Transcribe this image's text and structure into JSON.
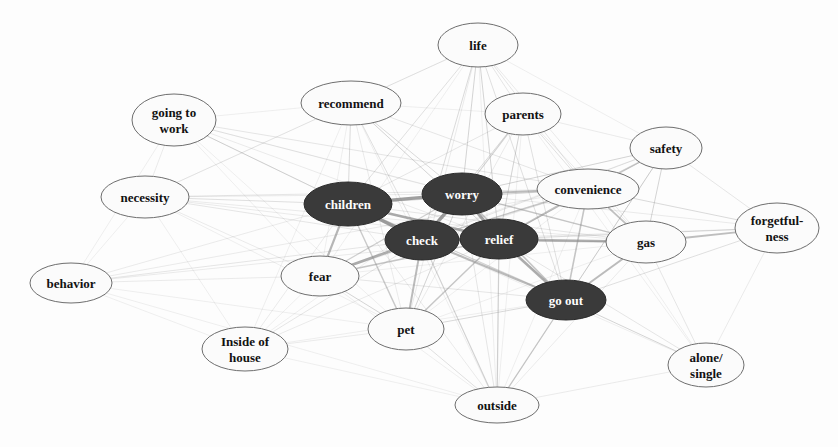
{
  "graph": {
    "title": "Co-occurrence network of reasons",
    "width": 838,
    "height": 447,
    "background_color": "#fdfdfd",
    "node_styles": {
      "dark_fill": "#3a3a3a",
      "dark_stroke": "#2b2b2b",
      "dark_text": "#fdfdfd",
      "light_fill": "#fbfbfb",
      "light_stroke": "#6e6e6e",
      "light_text": "#121212",
      "edge_color": "#8c8c8c"
    },
    "nodes": [
      {
        "id": "life",
        "label": "life",
        "lines": [
          "life"
        ],
        "cx": 478,
        "cy": 45,
        "rx": 40,
        "ry": 22,
        "style": "light",
        "font_size": 13
      },
      {
        "id": "recommend",
        "label": "recommend",
        "lines": [
          "recommend"
        ],
        "cx": 351,
        "cy": 103,
        "rx": 50,
        "ry": 22,
        "style": "light",
        "font_size": 13
      },
      {
        "id": "parents",
        "label": "parents",
        "lines": [
          "parents"
        ],
        "cx": 523,
        "cy": 114,
        "rx": 38,
        "ry": 21,
        "style": "light",
        "font_size": 13
      },
      {
        "id": "going_to_work",
        "label": "going to work",
        "lines": [
          "going to",
          "work"
        ],
        "cx": 174,
        "cy": 120,
        "rx": 42,
        "ry": 26,
        "style": "light",
        "font_size": 13
      },
      {
        "id": "safety",
        "label": "safety",
        "lines": [
          "safety"
        ],
        "cx": 666,
        "cy": 148,
        "rx": 36,
        "ry": 21,
        "style": "light",
        "font_size": 13
      },
      {
        "id": "convenience",
        "label": "convenience",
        "lines": [
          "convenience"
        ],
        "cx": 588,
        "cy": 189,
        "rx": 51,
        "ry": 20,
        "style": "light",
        "font_size": 13
      },
      {
        "id": "necessity",
        "label": "necessity",
        "lines": [
          "necessity"
        ],
        "cx": 145,
        "cy": 197,
        "rx": 44,
        "ry": 21,
        "style": "light",
        "font_size": 13
      },
      {
        "id": "children",
        "label": "children",
        "lines": [
          "children"
        ],
        "cx": 348,
        "cy": 204,
        "rx": 44,
        "ry": 22,
        "style": "dark",
        "font_size": 13
      },
      {
        "id": "worry",
        "label": "worry",
        "lines": [
          "worry"
        ],
        "cx": 462,
        "cy": 194,
        "rx": 40,
        "ry": 21,
        "style": "dark",
        "font_size": 13
      },
      {
        "id": "forgetfulness",
        "label": "forgetfulness",
        "lines": [
          "forgetful-",
          "ness"
        ],
        "cx": 777,
        "cy": 228,
        "rx": 42,
        "ry": 25,
        "style": "light",
        "font_size": 13
      },
      {
        "id": "check",
        "label": "check",
        "lines": [
          "check"
        ],
        "cx": 422,
        "cy": 240,
        "rx": 37,
        "ry": 20,
        "style": "dark",
        "font_size": 13
      },
      {
        "id": "relief",
        "label": "relief",
        "lines": [
          "relief"
        ],
        "cx": 499,
        "cy": 239,
        "rx": 39,
        "ry": 20,
        "style": "dark",
        "font_size": 13
      },
      {
        "id": "gas",
        "label": "gas",
        "lines": [
          "gas"
        ],
        "cx": 646,
        "cy": 242,
        "rx": 40,
        "ry": 21,
        "style": "light",
        "font_size": 13
      },
      {
        "id": "fear",
        "label": "fear",
        "lines": [
          "fear"
        ],
        "cx": 320,
        "cy": 276,
        "rx": 39,
        "ry": 20,
        "style": "light",
        "font_size": 13
      },
      {
        "id": "behavior",
        "label": "behavior",
        "lines": [
          "behavior"
        ],
        "cx": 71,
        "cy": 283,
        "rx": 41,
        "ry": 20,
        "style": "light",
        "font_size": 13
      },
      {
        "id": "go_out",
        "label": "go out",
        "lines": [
          "go out"
        ],
        "cx": 566,
        "cy": 300,
        "rx": 40,
        "ry": 20,
        "style": "dark",
        "font_size": 13
      },
      {
        "id": "pet",
        "label": "pet",
        "lines": [
          "pet"
        ],
        "cx": 406,
        "cy": 329,
        "rx": 38,
        "ry": 21,
        "style": "light",
        "font_size": 13
      },
      {
        "id": "inside_of_house",
        "label": "Inside of house",
        "lines": [
          "Inside of",
          "house"
        ],
        "cx": 245,
        "cy": 349,
        "rx": 43,
        "ry": 22,
        "style": "light",
        "font_size": 13
      },
      {
        "id": "alone_single",
        "label": "alone/single",
        "lines": [
          "alone/",
          "single"
        ],
        "cx": 706,
        "cy": 365,
        "rx": 38,
        "ry": 22,
        "style": "light",
        "font_size": 13
      },
      {
        "id": "outside",
        "label": "outside",
        "lines": [
          "outside"
        ],
        "cx": 497,
        "cy": 405,
        "rx": 42,
        "ry": 18,
        "style": "light",
        "font_size": 13
      }
    ],
    "edges": [
      {
        "source": "children",
        "target": "worry",
        "weight": 3.2
      },
      {
        "source": "children",
        "target": "check",
        "weight": 3.4
      },
      {
        "source": "children",
        "target": "relief",
        "weight": 2.8
      },
      {
        "source": "children",
        "target": "fear",
        "weight": 2.2
      },
      {
        "source": "children",
        "target": "pet",
        "weight": 1.4
      },
      {
        "source": "children",
        "target": "necessity",
        "weight": 0.8
      },
      {
        "source": "children",
        "target": "going_to_work",
        "weight": 0.8
      },
      {
        "source": "children",
        "target": "recommend",
        "weight": 0.9
      },
      {
        "source": "children",
        "target": "life",
        "weight": 0.8
      },
      {
        "source": "children",
        "target": "behavior",
        "weight": 0.6
      },
      {
        "source": "children",
        "target": "convenience",
        "weight": 1.0
      },
      {
        "source": "children",
        "target": "go_out",
        "weight": 1.1
      },
      {
        "source": "children",
        "target": "gas",
        "weight": 0.7
      },
      {
        "source": "children",
        "target": "inside_of_house",
        "weight": 0.6
      },
      {
        "source": "children",
        "target": "outside",
        "weight": 0.6
      },
      {
        "source": "children",
        "target": "parents",
        "weight": 0.7
      },
      {
        "source": "worry",
        "target": "check",
        "weight": 3.4
      },
      {
        "source": "worry",
        "target": "relief",
        "weight": 3.0
      },
      {
        "source": "worry",
        "target": "convenience",
        "weight": 2.0
      },
      {
        "source": "worry",
        "target": "parents",
        "weight": 1.1
      },
      {
        "source": "worry",
        "target": "life",
        "weight": 1.0
      },
      {
        "source": "worry",
        "target": "recommend",
        "weight": 0.9
      },
      {
        "source": "worry",
        "target": "gas",
        "weight": 1.3
      },
      {
        "source": "worry",
        "target": "go_out",
        "weight": 1.6
      },
      {
        "source": "worry",
        "target": "safety",
        "weight": 1.0
      },
      {
        "source": "worry",
        "target": "fear",
        "weight": 1.2
      },
      {
        "source": "worry",
        "target": "pet",
        "weight": 1.0
      },
      {
        "source": "worry",
        "target": "outside",
        "weight": 0.7
      },
      {
        "source": "worry",
        "target": "going_to_work",
        "weight": 0.6
      },
      {
        "source": "worry",
        "target": "necessity",
        "weight": 0.6
      },
      {
        "source": "worry",
        "target": "forgetfulness",
        "weight": 0.6
      },
      {
        "source": "worry",
        "target": "inside_of_house",
        "weight": 0.5
      },
      {
        "source": "check",
        "target": "relief",
        "weight": 3.6
      },
      {
        "source": "check",
        "target": "fear",
        "weight": 2.6
      },
      {
        "source": "check",
        "target": "pet",
        "weight": 2.0
      },
      {
        "source": "check",
        "target": "go_out",
        "weight": 2.0
      },
      {
        "source": "check",
        "target": "gas",
        "weight": 1.6
      },
      {
        "source": "check",
        "target": "convenience",
        "weight": 1.5
      },
      {
        "source": "check",
        "target": "outside",
        "weight": 1.1
      },
      {
        "source": "check",
        "target": "life",
        "weight": 0.9
      },
      {
        "source": "check",
        "target": "parents",
        "weight": 0.9
      },
      {
        "source": "check",
        "target": "recommend",
        "weight": 0.8
      },
      {
        "source": "check",
        "target": "necessity",
        "weight": 0.7
      },
      {
        "source": "check",
        "target": "going_to_work",
        "weight": 0.7
      },
      {
        "source": "check",
        "target": "behavior",
        "weight": 0.7
      },
      {
        "source": "check",
        "target": "inside_of_house",
        "weight": 0.7
      },
      {
        "source": "check",
        "target": "safety",
        "weight": 0.7
      },
      {
        "source": "check",
        "target": "forgetfulness",
        "weight": 0.6
      },
      {
        "source": "check",
        "target": "alone_single",
        "weight": 0.5
      },
      {
        "source": "relief",
        "target": "go_out",
        "weight": 2.6
      },
      {
        "source": "relief",
        "target": "gas",
        "weight": 2.2
      },
      {
        "source": "relief",
        "target": "convenience",
        "weight": 1.8
      },
      {
        "source": "relief",
        "target": "fear",
        "weight": 1.6
      },
      {
        "source": "relief",
        "target": "pet",
        "weight": 1.5
      },
      {
        "source": "relief",
        "target": "outside",
        "weight": 1.2
      },
      {
        "source": "relief",
        "target": "parents",
        "weight": 1.0
      },
      {
        "source": "relief",
        "target": "life",
        "weight": 1.0
      },
      {
        "source": "relief",
        "target": "safety",
        "weight": 0.9
      },
      {
        "source": "relief",
        "target": "recommend",
        "weight": 0.8
      },
      {
        "source": "relief",
        "target": "forgetfulness",
        "weight": 0.9
      },
      {
        "source": "relief",
        "target": "alone_single",
        "weight": 0.7
      },
      {
        "source": "relief",
        "target": "necessity",
        "weight": 0.6
      },
      {
        "source": "relief",
        "target": "going_to_work",
        "weight": 0.6
      },
      {
        "source": "relief",
        "target": "behavior",
        "weight": 0.6
      },
      {
        "source": "relief",
        "target": "inside_of_house",
        "weight": 0.6
      },
      {
        "source": "go_out",
        "target": "gas",
        "weight": 2.0
      },
      {
        "source": "go_out",
        "target": "convenience",
        "weight": 1.6
      },
      {
        "source": "go_out",
        "target": "outside",
        "weight": 1.3
      },
      {
        "source": "go_out",
        "target": "alone_single",
        "weight": 1.0
      },
      {
        "source": "go_out",
        "target": "safety",
        "weight": 1.0
      },
      {
        "source": "go_out",
        "target": "parents",
        "weight": 0.8
      },
      {
        "source": "go_out",
        "target": "life",
        "weight": 0.8
      },
      {
        "source": "go_out",
        "target": "pet",
        "weight": 0.9
      },
      {
        "source": "go_out",
        "target": "forgetfulness",
        "weight": 0.8
      },
      {
        "source": "go_out",
        "target": "fear",
        "weight": 0.7
      },
      {
        "source": "go_out",
        "target": "inside_of_house",
        "weight": 0.5
      },
      {
        "source": "go_out",
        "target": "recommend",
        "weight": 0.5
      },
      {
        "source": "convenience",
        "target": "gas",
        "weight": 1.8
      },
      {
        "source": "convenience",
        "target": "safety",
        "weight": 1.4
      },
      {
        "source": "convenience",
        "target": "forgetfulness",
        "weight": 0.9
      },
      {
        "source": "convenience",
        "target": "parents",
        "weight": 0.8
      },
      {
        "source": "convenience",
        "target": "life",
        "weight": 0.7
      },
      {
        "source": "convenience",
        "target": "recommend",
        "weight": 0.7
      },
      {
        "source": "convenience",
        "target": "necessity",
        "weight": 0.7
      },
      {
        "source": "convenience",
        "target": "going_to_work",
        "weight": 0.7
      },
      {
        "source": "convenience",
        "target": "behavior",
        "weight": 0.6
      },
      {
        "source": "convenience",
        "target": "fear",
        "weight": 0.6
      },
      {
        "source": "convenience",
        "target": "pet",
        "weight": 0.5
      },
      {
        "source": "convenience",
        "target": "alone_single",
        "weight": 0.5
      },
      {
        "source": "convenience",
        "target": "outside",
        "weight": 0.5
      },
      {
        "source": "gas",
        "target": "forgetfulness",
        "weight": 1.9
      },
      {
        "source": "gas",
        "target": "safety",
        "weight": 1.0
      },
      {
        "source": "gas",
        "target": "alone_single",
        "weight": 0.7
      },
      {
        "source": "gas",
        "target": "parents",
        "weight": 0.6
      },
      {
        "source": "gas",
        "target": "outside",
        "weight": 0.6
      },
      {
        "source": "gas",
        "target": "life",
        "weight": 0.6
      },
      {
        "source": "gas",
        "target": "necessity",
        "weight": 0.6
      },
      {
        "source": "gas",
        "target": "fear",
        "weight": 0.5
      },
      {
        "source": "gas",
        "target": "pet",
        "weight": 0.5
      },
      {
        "source": "gas",
        "target": "going_to_work",
        "weight": 0.5
      },
      {
        "source": "safety",
        "target": "forgetfulness",
        "weight": 0.7
      },
      {
        "source": "safety",
        "target": "parents",
        "weight": 0.6
      },
      {
        "source": "safety",
        "target": "life",
        "weight": 0.5
      },
      {
        "source": "safety",
        "target": "fear",
        "weight": 0.5
      },
      {
        "source": "safety",
        "target": "outside",
        "weight": 0.5
      },
      {
        "source": "fear",
        "target": "pet",
        "weight": 1.0
      },
      {
        "source": "fear",
        "target": "necessity",
        "weight": 0.6
      },
      {
        "source": "fear",
        "target": "behavior",
        "weight": 0.6
      },
      {
        "source": "fear",
        "target": "going_to_work",
        "weight": 0.5
      },
      {
        "source": "fear",
        "target": "inside_of_house",
        "weight": 0.5
      },
      {
        "source": "fear",
        "target": "outside",
        "weight": 0.5
      },
      {
        "source": "fear",
        "target": "recommend",
        "weight": 0.5
      },
      {
        "source": "fear",
        "target": "life",
        "weight": 0.5
      },
      {
        "source": "pet",
        "target": "outside",
        "weight": 0.8
      },
      {
        "source": "pet",
        "target": "inside_of_house",
        "weight": 0.6
      },
      {
        "source": "pet",
        "target": "life",
        "weight": 0.6
      },
      {
        "source": "pet",
        "target": "parents",
        "weight": 0.6
      },
      {
        "source": "pet",
        "target": "recommend",
        "weight": 0.6
      },
      {
        "source": "life",
        "target": "parents",
        "weight": 0.7
      },
      {
        "source": "life",
        "target": "recommend",
        "weight": 0.6
      },
      {
        "source": "life",
        "target": "outside",
        "weight": 0.5
      },
      {
        "source": "life",
        "target": "necessity",
        "weight": 0.5
      },
      {
        "source": "parents",
        "target": "recommend",
        "weight": 0.5
      },
      {
        "source": "parents",
        "target": "outside",
        "weight": 0.5
      },
      {
        "source": "parents",
        "target": "alone_single",
        "weight": 0.5
      },
      {
        "source": "recommend",
        "target": "necessity",
        "weight": 0.5
      },
      {
        "source": "recommend",
        "target": "going_to_work",
        "weight": 0.5
      },
      {
        "source": "recommend",
        "target": "inside_of_house",
        "weight": 0.5
      },
      {
        "source": "recommend",
        "target": "outside",
        "weight": 0.5
      },
      {
        "source": "going_to_work",
        "target": "necessity",
        "weight": 0.6
      },
      {
        "source": "going_to_work",
        "target": "behavior",
        "weight": 0.5
      },
      {
        "source": "going_to_work",
        "target": "pet",
        "weight": 0.5
      },
      {
        "source": "necessity",
        "target": "behavior",
        "weight": 0.5
      },
      {
        "source": "necessity",
        "target": "pet",
        "weight": 0.5
      },
      {
        "source": "necessity",
        "target": "inside_of_house",
        "weight": 0.5
      },
      {
        "source": "behavior",
        "target": "pet",
        "weight": 0.5
      },
      {
        "source": "behavior",
        "target": "inside_of_house",
        "weight": 0.5
      },
      {
        "source": "behavior",
        "target": "outside",
        "weight": 0.5
      },
      {
        "source": "inside_of_house",
        "target": "outside",
        "weight": 0.5
      },
      {
        "source": "outside",
        "target": "alone_single",
        "weight": 0.6
      },
      {
        "source": "forgetfulness",
        "target": "alone_single",
        "weight": 0.6
      }
    ]
  }
}
